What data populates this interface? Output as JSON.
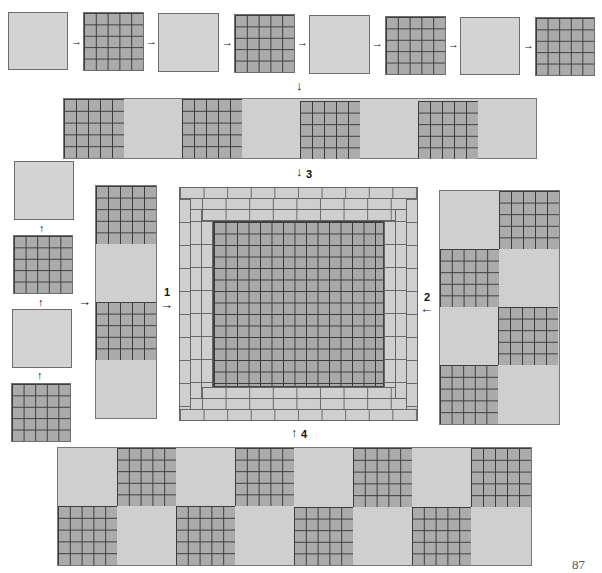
{
  "figure": {
    "type": "quilt assembly diagram",
    "page_number": "87",
    "block_types": {
      "plain": "solid light gray square",
      "grid": "5x5 gridded square"
    },
    "colors": {
      "plain": "#d3d3d3",
      "grid_fill": "#ababab",
      "grid_lines": "#3c3c3c",
      "outline": "#6e6e6e"
    },
    "steps": [
      {
        "id": "top-row-sequence",
        "description": "8 blocks alternating plain/grid joined left to right",
        "blocks": [
          "plain",
          "grid",
          "plain",
          "grid",
          "plain",
          "grid",
          "plain",
          "grid"
        ]
      },
      {
        "id": "top-strip",
        "description": "Joined 8-block horizontal strip",
        "blocks": [
          "grid",
          "plain",
          "grid",
          "plain",
          "grid",
          "plain",
          "grid",
          "plain"
        ]
      },
      {
        "id": "left-column-sequence",
        "description": "4 blocks stacked bottom to top",
        "blocks": [
          "plain",
          "grid",
          "plain",
          "grid"
        ]
      },
      {
        "id": "left-strip",
        "description": "Joined 4-block vertical strip",
        "blocks": [
          "grid",
          "plain",
          "grid",
          "plain"
        ]
      },
      {
        "id": "right-panel",
        "description": "2x4 checkerboard panel",
        "rows": [
          [
            "plain",
            "grid"
          ],
          [
            "grid",
            "plain"
          ],
          [
            "plain",
            "grid"
          ],
          [
            "grid",
            "plain"
          ]
        ]
      },
      {
        "id": "bottom-panel",
        "description": "8x2 checkerboard panel",
        "rows": [
          [
            "plain",
            "grid",
            "plain",
            "grid",
            "plain",
            "grid",
            "plain",
            "grid"
          ],
          [
            "grid",
            "plain",
            "grid",
            "plain",
            "grid",
            "plain",
            "grid",
            "plain"
          ]
        ]
      }
    ],
    "center": {
      "description": "Central gridded field surrounded by three rings of brick borders",
      "inner_grid": "15x15",
      "border_rings": 3
    },
    "labels": {
      "step1": "1",
      "step2": "2",
      "step3": "3",
      "step4": "4"
    },
    "arrows": {
      "right": "→",
      "down": "↓",
      "up": "↑",
      "left": "←"
    }
  }
}
